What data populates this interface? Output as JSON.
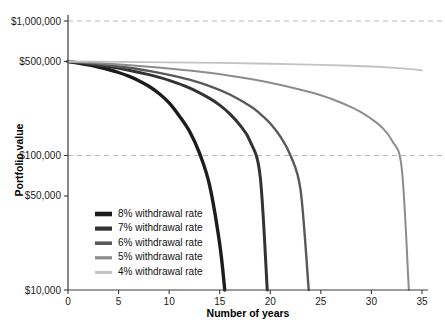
{
  "chart_data": {
    "type": "line",
    "title": "",
    "xlabel": "Number of years",
    "ylabel": "Portfolio value",
    "xlim": [
      0,
      35
    ],
    "ylim": [
      10000,
      1000000
    ],
    "yscale": "log",
    "grid": "dashed horizontal gridlines at $1,000,000 and $100,000",
    "legend_position": "inside lower-left",
    "x_ticks": [
      0,
      5,
      10,
      15,
      20,
      25,
      30,
      35
    ],
    "x_tick_labels": [
      "0",
      "5",
      "10",
      "15",
      "20",
      "25",
      "30",
      "35"
    ],
    "y_ticks": [
      10000,
      50000,
      100000,
      500000,
      1000000
    ],
    "y_tick_labels": [
      "$10,000",
      "$50,000",
      "$100,000",
      "$500,000",
      "$1,000,000"
    ],
    "starting_value": 500000,
    "series": [
      {
        "name": "8% withdrawal rate",
        "legend_label": "8% withdrawal rate",
        "color": "#1c1c1c",
        "depletion_year": 15.5,
        "x": [
          0,
          1,
          2,
          3,
          4,
          5,
          6,
          7,
          8,
          9,
          10,
          11,
          12,
          13,
          14,
          15,
          15.5
        ],
        "y": [
          500000,
          487000,
          472000,
          455000,
          436000,
          414000,
          389000,
          360000,
          327000,
          289000,
          246000,
          197000,
          152000,
          104000,
          60000,
          22000,
          10000
        ]
      },
      {
        "name": "7% withdrawal rate",
        "legend_label": "7% withdrawal rate",
        "color": "#333333",
        "depletion_year": 19.7,
        "x": [
          0,
          2,
          4,
          6,
          8,
          10,
          12,
          14,
          15,
          16,
          17,
          18,
          19,
          19.7
        ],
        "y": [
          500000,
          481000,
          458000,
          431000,
          399000,
          362000,
          318000,
          266000,
          237000,
          204000,
          168000,
          128000,
          70000,
          10000
        ]
      },
      {
        "name": "6% withdrawal rate",
        "legend_label": "6% withdrawal rate",
        "color": "#595959",
        "depletion_year": 23.8,
        "x": [
          0,
          2,
          4,
          6,
          8,
          10,
          12,
          14,
          16,
          18,
          19,
          20,
          21,
          22,
          23,
          23.8
        ],
        "y": [
          500000,
          486000,
          469000,
          449000,
          426000,
          398000,
          366000,
          328000,
          284000,
          233000,
          204000,
          173000,
          138000,
          100000,
          55000,
          10000
        ]
      },
      {
        "name": "5% withdrawal rate",
        "legend_label": "5% withdrawal rate",
        "color": "#8c8c8c",
        "depletion_year": 33.7,
        "x": [
          0,
          4,
          8,
          12,
          16,
          20,
          24,
          26,
          28,
          29,
          30,
          31,
          32,
          33,
          33.7
        ],
        "y": [
          500000,
          481000,
          457000,
          428000,
          392000,
          348000,
          295000,
          264000,
          229000,
          209000,
          187000,
          163000,
          130000,
          80000,
          10000
        ]
      },
      {
        "name": "4% withdrawal rate",
        "legend_label": "4% withdrawal rate",
        "color": "#c2c2c2",
        "depletion_year": null,
        "x": [
          0,
          5,
          10,
          15,
          20,
          25,
          28,
          30,
          32,
          34,
          35
        ],
        "y": [
          500000,
          497000,
          493000,
          488000,
          481000,
          472000,
          465000,
          459000,
          450000,
          438000,
          430000
        ]
      }
    ]
  },
  "axes": {
    "y_title": "Portfolio value",
    "x_title": "Number of years",
    "y_labels": {
      "l1000000": "$1,000,000",
      "l500000": "$500,000",
      "l100000": "$100,000",
      "l50000": "$50,000",
      "l10000": "$10,000"
    },
    "x_labels": {
      "t0": "0",
      "t5": "5",
      "t10": "10",
      "t15": "15",
      "t20": "20",
      "t25": "25",
      "t30": "30",
      "t35": "35"
    }
  },
  "legend": {
    "items": [
      {
        "label": "8% withdrawal rate",
        "color": "#1c1c1c",
        "width": 3.4
      },
      {
        "label": "7% withdrawal rate",
        "color": "#333333",
        "width": 3.0
      },
      {
        "label": "6% withdrawal rate",
        "color": "#595959",
        "width": 2.4
      },
      {
        "label": "5% withdrawal rate",
        "color": "#8c8c8c",
        "width": 2.0
      },
      {
        "label": "4% withdrawal rate",
        "color": "#c2c2c2",
        "width": 1.8
      }
    ]
  },
  "colors": {
    "axis": "#3a3a3a",
    "gridline": "#b9b9b9",
    "background": "#ffffff",
    "text": "#111111"
  }
}
